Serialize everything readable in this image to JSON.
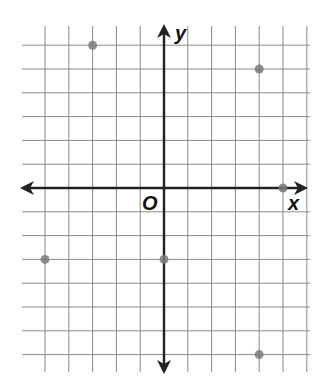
{
  "diagram": {
    "type": "coordinate-plane",
    "axes": {
      "x_label": "x",
      "y_label": "y",
      "origin_label": "O"
    },
    "grid": {
      "x_range": [
        -6,
        6
      ],
      "y_range": [
        -7,
        6
      ],
      "unit": 1
    },
    "points": [
      {
        "x": -3,
        "y": 6
      },
      {
        "x": 4,
        "y": 5
      },
      {
        "x": 5,
        "y": 0
      },
      {
        "x": -5,
        "y": -3
      },
      {
        "x": 0,
        "y": -3
      },
      {
        "x": 4,
        "y": -7
      }
    ],
    "colors": {
      "grid": "#8a8a8a",
      "axis": "#222222",
      "point": "#7a7a7a"
    }
  }
}
